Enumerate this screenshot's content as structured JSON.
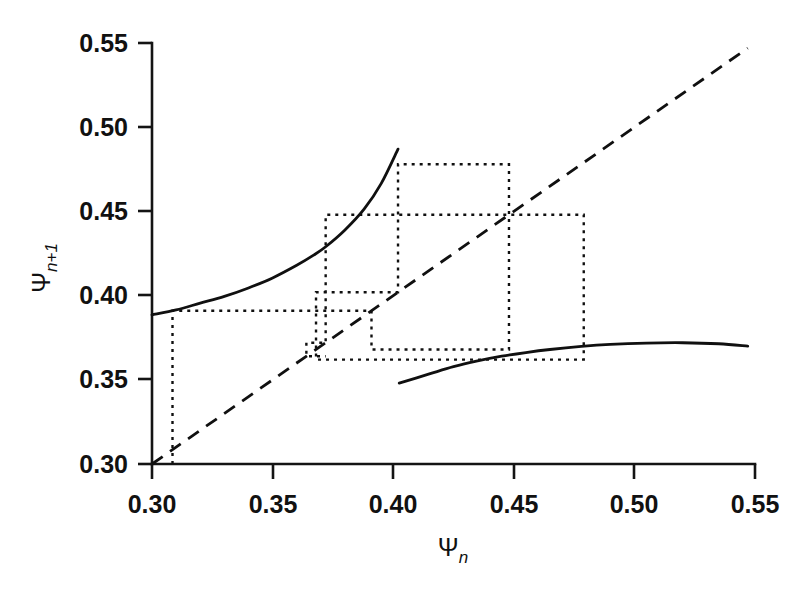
{
  "chart_data": {
    "type": "line",
    "title": "",
    "subtitle": "",
    "xlabel": "Ψn",
    "ylabel": "Ψn+1",
    "xlabel_base": "Ψ",
    "xlabel_sub": "n",
    "ylabel_base": "Ψ",
    "ylabel_sub": "n+1",
    "xlim": [
      0.3,
      0.55
    ],
    "ylim": [
      0.3,
      0.55
    ],
    "xticks": [
      0.3,
      0.35,
      0.4,
      0.45,
      0.5,
      0.55
    ],
    "yticks": [
      0.3,
      0.35,
      0.4,
      0.45,
      0.5,
      0.55
    ],
    "xtick_labels": [
      "0.30",
      "0.35",
      "0.40",
      "0.45",
      "0.50",
      "0.55"
    ],
    "ytick_labels": [
      "0.30",
      "0.35",
      "0.40",
      "0.45",
      "0.50",
      "0.55"
    ],
    "grid": false,
    "legend": null,
    "legend_position": "none",
    "line_color": "#101010",
    "background_color": "#ffffff",
    "series": [
      {
        "name": "upper-branch",
        "style": "solid",
        "x": [
          0.3,
          0.31,
          0.32,
          0.33,
          0.34,
          0.35,
          0.36,
          0.367,
          0.372,
          0.38,
          0.388,
          0.395,
          0.402
        ],
        "y": [
          0.3885,
          0.3915,
          0.3955,
          0.3995,
          0.4045,
          0.4105,
          0.418,
          0.424,
          0.429,
          0.439,
          0.4515,
          0.4665,
          0.487
        ]
      },
      {
        "name": "lower-branch",
        "style": "solid",
        "x": [
          0.4025,
          0.415,
          0.425,
          0.435,
          0.445,
          0.455,
          0.465,
          0.478,
          0.49,
          0.505,
          0.52,
          0.535,
          0.547
        ],
        "y": [
          0.348,
          0.3535,
          0.3578,
          0.3612,
          0.364,
          0.3662,
          0.368,
          0.3698,
          0.371,
          0.3718,
          0.372,
          0.3714,
          0.37
        ]
      },
      {
        "name": "identity-diagonal",
        "style": "dashed",
        "x": [
          0.3,
          0.547
        ],
        "y": [
          0.3,
          0.547
        ]
      }
    ],
    "cobweb": {
      "style": "dotted",
      "description": "staircase iteration path between the map branches and the identity line",
      "vertices": [
        [
          0.3085,
          0.3
        ],
        [
          0.3085,
          0.391
        ],
        [
          0.391,
          0.391
        ],
        [
          0.391,
          0.368
        ],
        [
          0.448,
          0.368
        ],
        [
          0.448,
          0.478
        ],
        [
          0.402,
          0.478
        ],
        [
          0.402,
          0.402
        ],
        [
          0.368,
          0.402
        ],
        [
          0.368,
          0.362
        ],
        [
          0.479,
          0.362
        ],
        [
          0.479,
          0.448
        ],
        [
          0.372,
          0.448
        ],
        [
          0.372,
          0.372
        ],
        [
          0.364,
          0.372
        ],
        [
          0.364,
          0.364
        ],
        [
          0.372,
          0.364
        ]
      ]
    },
    "annotations": []
  },
  "axes": {
    "x_axis_name": "x-axis",
    "y_axis_name": "y-axis",
    "tick_direction": "outward"
  }
}
